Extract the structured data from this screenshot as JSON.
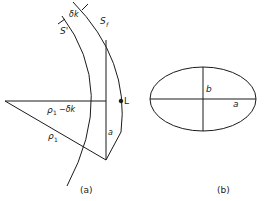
{
  "figure_a": {
    "caption": "(a)",
    "labels": {
      "delta_k": "δk",
      "s_prime": "S'",
      "s_f": "S",
      "s_f_sub": "f",
      "point_L": "L",
      "side_a": "a",
      "rho_minus": "ρ",
      "rho_minus_sub": "1",
      "rho_minus_suffix": "−δk",
      "rho": "ρ",
      "rho_sub": "1"
    }
  },
  "figure_b": {
    "caption": "(b)",
    "labels": {
      "semi_minor": "b",
      "semi_major": "a"
    }
  },
  "colors": {
    "stroke": "#1a1a1a",
    "background": "#ffffff"
  }
}
